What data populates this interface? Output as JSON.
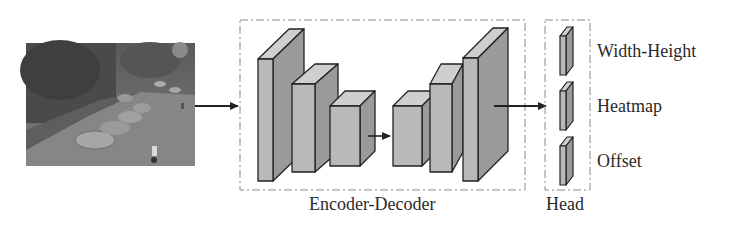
{
  "diagram": {
    "input": {
      "description": "street scene photo with parked cars and cyclists"
    },
    "groups": {
      "encoder_decoder": {
        "label": "Encoder-Decoder"
      },
      "head": {
        "label": "Head"
      }
    },
    "head_outputs": [
      {
        "label": "Width-Height"
      },
      {
        "label": "Heatmap"
      },
      {
        "label": "Offset"
      }
    ],
    "colors": {
      "block_front": "#b9b9b9",
      "block_side": "#9a9a9a",
      "block_top": "#cfcfcf",
      "outline": "#222222",
      "dash_box": "#8a8a8a"
    }
  }
}
